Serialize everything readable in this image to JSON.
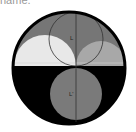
{
  "caption": "name.",
  "diagram": {
    "labels": {
      "top_circle": "L",
      "bottom_circle": "L'"
    },
    "colors": {
      "outer_border": "#000000",
      "top_background": "#767676",
      "bottom_background": "#000000",
      "left_semicircle": "#e8e8e8",
      "right_semicircle": "#a8a8a8",
      "bottom_circle": "#7a7a7a",
      "outline": "#333333"
    }
  }
}
